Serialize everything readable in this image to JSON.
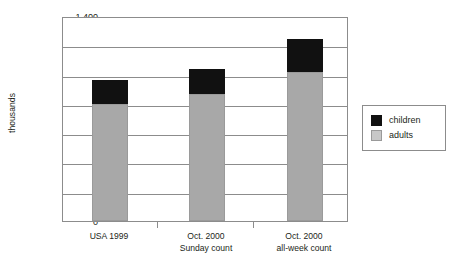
{
  "chart_data": {
    "type": "bar",
    "stacked": true,
    "title": "",
    "xlabel": "",
    "ylabel": "thousands",
    "ylim": [
      0,
      1400
    ],
    "ytick_step": 200,
    "ytick_labels": [
      "1,400",
      "1,200",
      "1,000",
      "800",
      "600",
      "400",
      "200",
      "0"
    ],
    "grid": true,
    "legend_position": "right",
    "categories": [
      "USA 1999",
      "Oct. 2000 Sunday count",
      "Oct. 2000 all-week count"
    ],
    "category_lines": [
      [
        "USA 1999",
        ""
      ],
      [
        "Oct. 2000",
        "Sunday count"
      ],
      [
        "Oct. 2000",
        "all-week count"
      ]
    ],
    "series": [
      {
        "name": "adults",
        "color": "#a8a8a8",
        "values": [
          800,
          865,
          1015
        ]
      },
      {
        "name": "children",
        "color": "#111111",
        "values": [
          160,
          170,
          230
        ]
      }
    ],
    "totals": [
      960,
      1035,
      1245
    ]
  },
  "legend": {
    "items": [
      {
        "label": "children",
        "swatch": "children"
      },
      {
        "label": "adults",
        "swatch": "adults"
      }
    ]
  }
}
